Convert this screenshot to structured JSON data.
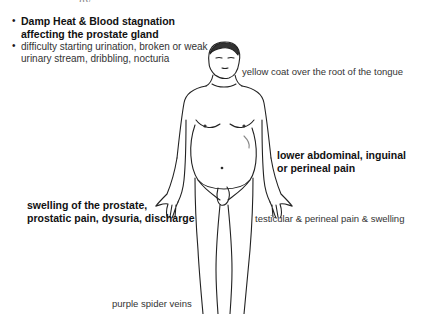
{
  "diagram": {
    "cropped_title_fragment": "...gy ...",
    "summary": {
      "pattern": "Damp Heat & Blood stagnation affecting the prostate gland",
      "symptoms": "difficulty starting urination, broken or weak urinary stream, dribbling, nocturia"
    },
    "labels": {
      "tongue": "yellow coat over the root of the tongue",
      "abdominal_line1": "lower abdominal, inguinal",
      "abdominal_line2": "or perineal pain",
      "prostate_line1": "swelling of the prostate,",
      "prostate_line2": "prostatic pain, dysuria, discharge",
      "testicular": "testicular & perineal pain & swelling",
      "veins": "purple spider veins"
    },
    "bullet_glyph": "•"
  }
}
